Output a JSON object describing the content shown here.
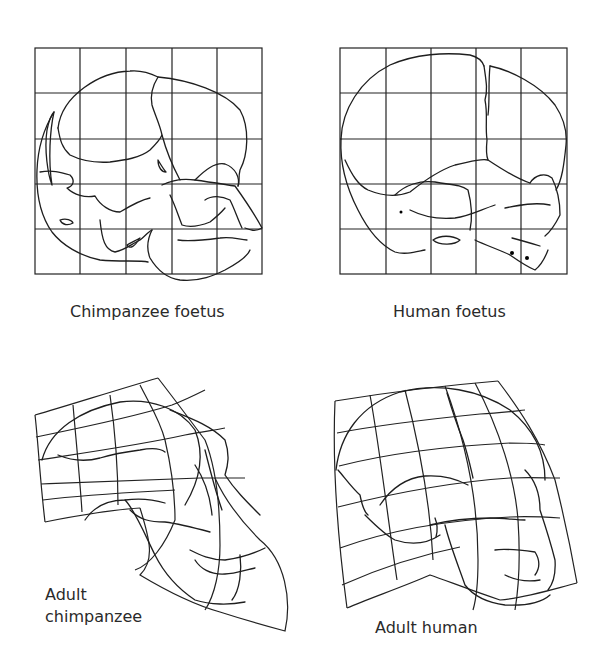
{
  "figure": {
    "panels": [
      {
        "id": "chimpanzee-foetus",
        "label": "Chimpanzee foetus",
        "grid": "5x5 square"
      },
      {
        "id": "human-foetus",
        "label": "Human foetus",
        "grid": "5x5 square"
      },
      {
        "id": "adult-chimpanzee",
        "label_line1": "Adult",
        "label_line2": "chimpanzee",
        "grid": "deformed"
      },
      {
        "id": "adult-human",
        "label": "Adult human",
        "grid": "deformed"
      }
    ]
  }
}
